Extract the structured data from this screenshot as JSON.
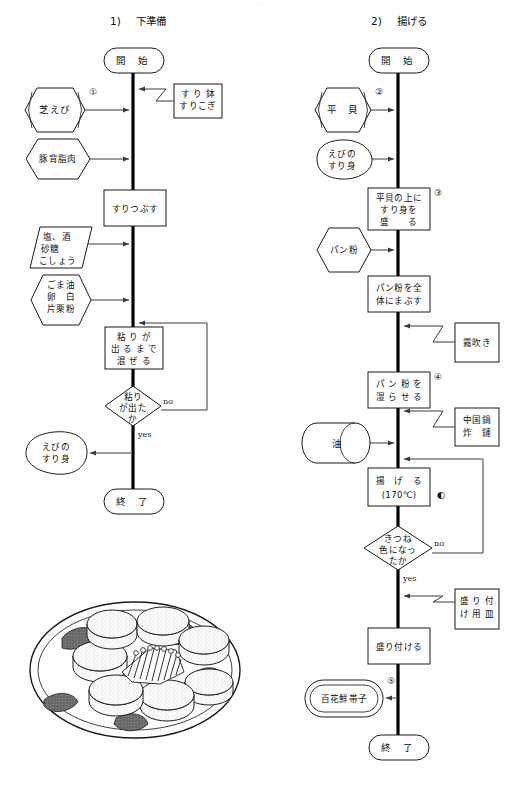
{
  "page": {
    "width": 526,
    "height": 785,
    "background": "#ffffff",
    "ink": "#1a1a1a",
    "faint_top_text": "· · · · ·"
  },
  "columns": [
    {
      "number": "1)",
      "title": "下準備"
    },
    {
      "number": "2)",
      "title": "揚げる"
    }
  ],
  "labels": {
    "start": "開 始",
    "end": "終 了",
    "yes": "yes",
    "no": "no"
  },
  "left_flow": {
    "start": "開 始",
    "end": "終 了",
    "inputs": [
      {
        "name": "shiba-ebi",
        "lines": [
          "芝えび"
        ],
        "shape": "hexagon-double",
        "marker": "①"
      },
      {
        "name": "pork-back-fat",
        "lines": [
          "豚背脂肉"
        ],
        "shape": "hexagon",
        "marker": ""
      },
      {
        "name": "seasonings",
        "lines": [
          "塩、酒",
          "砂糖",
          "こしょう"
        ],
        "shape": "parallelogram",
        "marker": ""
      },
      {
        "name": "binders",
        "lines": [
          "ごま油",
          "卵　白",
          "片栗粉"
        ],
        "shape": "hexagon",
        "marker": ""
      }
    ],
    "tools": [
      {
        "name": "mortar-pestle",
        "lines": [
          "す り 鉢",
          "すりこぎ"
        ]
      }
    ],
    "processes": [
      {
        "name": "grind",
        "lines": [
          "すりつぶす"
        ]
      },
      {
        "name": "mix-until-sticky",
        "lines": [
          "粘 り が",
          "出 る ま で",
          "混 ぜ る"
        ]
      }
    ],
    "decisions": [
      {
        "name": "is-sticky",
        "lines": [
          "粘り",
          "が出た",
          "か"
        ],
        "yes": "yes",
        "no": "no"
      }
    ],
    "outputs": [
      {
        "name": "shrimp-paste",
        "lines": [
          "えびの",
          "すり身"
        ],
        "shape": "blob",
        "marker": ""
      }
    ]
  },
  "right_flow": {
    "start": "開 始",
    "end": "終 了",
    "inputs": [
      {
        "name": "pen-shell",
        "lines": [
          "平　貝"
        ],
        "shape": "hexagon-double",
        "marker": "②"
      },
      {
        "name": "shrimp-paste",
        "lines": [
          "えびの",
          "すり身"
        ],
        "shape": "blob",
        "marker": ""
      },
      {
        "name": "breadcrumbs",
        "lines": [
          "パン粉"
        ],
        "shape": "hexagon",
        "marker": ""
      },
      {
        "name": "oil",
        "lines": [
          "油"
        ],
        "shape": "cylinder",
        "marker": ""
      }
    ],
    "tools": [
      {
        "name": "spray-bottle",
        "lines": [
          "霧吹き"
        ]
      },
      {
        "name": "chinese-wok",
        "lines": [
          "中国鍋",
          "炸　鏈"
        ]
      },
      {
        "name": "serving-plate",
        "lines": [
          "盛 り 付",
          "け 用 皿"
        ]
      }
    ],
    "processes": [
      {
        "name": "heap-paste-on-shell",
        "lines": [
          "平貝の上に",
          "すり身を",
          "盛　　る"
        ],
        "marker": "③"
      },
      {
        "name": "coat-with-breadcrumbs",
        "lines": [
          "パン粉を全",
          "体にまぶす"
        ],
        "marker": ""
      },
      {
        "name": "moisten-breadcrumbs",
        "lines": [
          "パ ン 粉 を",
          "湿 ら せ る"
        ],
        "marker": "④"
      },
      {
        "name": "deep-fry",
        "lines": [
          "揚　げ　る",
          "(170℃)"
        ],
        "marker": ""
      },
      {
        "name": "plate-up",
        "lines": [
          "盛り付ける"
        ],
        "marker": ""
      }
    ],
    "decisions": [
      {
        "name": "golden-brown",
        "lines": [
          "きつね",
          "色になっ",
          "たか"
        ],
        "yes": "yes",
        "no": "no"
      }
    ],
    "outputs": [
      {
        "name": "finished-dish",
        "lines": [
          "百花鮮帯子"
        ],
        "shape": "stadium-double",
        "marker": "⑤"
      }
    ],
    "annotations": [
      {
        "name": "half-circle-marker",
        "glyph": "◐"
      }
    ]
  },
  "illustration": {
    "name": "plated-dish-drawing",
    "caption": ""
  }
}
